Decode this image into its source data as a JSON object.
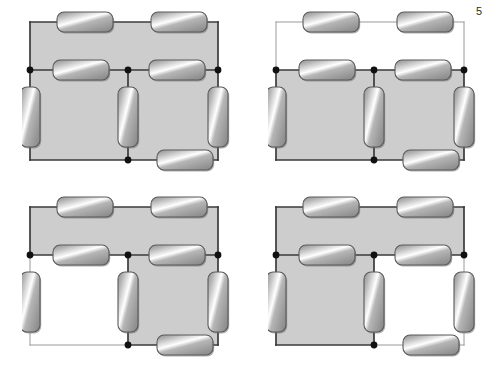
{
  "figure": {
    "title": "",
    "background_color": "#ffffff",
    "shade_color": "#cdcdcd",
    "wire_color_dark": "#3a3a3a",
    "wire_color_light": "#9a9a9a",
    "node_color": "#111111",
    "resistor_body_light": "#f2f2f2",
    "resistor_body_mid": "#b6b6b6",
    "resistor_body_dark": "#8f8f8f",
    "resistor_border": "#5a5a5a",
    "corner_note": "5"
  },
  "panels": [
    {
      "id": "panel-top-left",
      "name": "circuit-top-left",
      "label": "",
      "x": 22,
      "y": 8,
      "width": 212,
      "height": 176,
      "shaded_loops": [
        "top",
        "bottom-left",
        "bottom-right"
      ],
      "unshaded_loops": [],
      "dim_wires": [],
      "resistors": [
        {
          "name": "r-top-left",
          "orientation": "horizontal",
          "loop_edge": "top-left"
        },
        {
          "name": "r-top-right",
          "orientation": "horizontal",
          "loop_edge": "top-right"
        },
        {
          "name": "r-middle-left",
          "orientation": "horizontal",
          "loop_edge": "middle-left"
        },
        {
          "name": "r-middle-right",
          "orientation": "horizontal",
          "loop_edge": "middle-right"
        },
        {
          "name": "r-bottom-right",
          "orientation": "horizontal",
          "loop_edge": "bottom-right"
        },
        {
          "name": "r-left-branch",
          "orientation": "vertical",
          "loop_edge": "left"
        },
        {
          "name": "r-center-branch",
          "orientation": "vertical",
          "loop_edge": "center"
        },
        {
          "name": "r-right-branch",
          "orientation": "vertical",
          "loop_edge": "right"
        }
      ],
      "nodes": [
        "left-middle",
        "center-middle",
        "right-middle",
        "center-bottom"
      ]
    },
    {
      "id": "panel-top-right",
      "name": "circuit-top-right",
      "label": "",
      "x": 268,
      "y": 8,
      "width": 212,
      "height": 176,
      "shaded_loops": [
        "bottom-left",
        "bottom-right"
      ],
      "unshaded_loops": [
        "top"
      ],
      "dim_wires": [
        "top-rail",
        "left-upper",
        "right-upper"
      ],
      "resistors": [
        {
          "name": "r-top-left",
          "orientation": "horizontal",
          "loop_edge": "top-left"
        },
        {
          "name": "r-top-right",
          "orientation": "horizontal",
          "loop_edge": "top-right"
        },
        {
          "name": "r-middle-left",
          "orientation": "horizontal",
          "loop_edge": "middle-left"
        },
        {
          "name": "r-middle-right",
          "orientation": "horizontal",
          "loop_edge": "middle-right"
        },
        {
          "name": "r-bottom-right",
          "orientation": "horizontal",
          "loop_edge": "bottom-right"
        },
        {
          "name": "r-left-branch",
          "orientation": "vertical",
          "loop_edge": "left"
        },
        {
          "name": "r-center-branch",
          "orientation": "vertical",
          "loop_edge": "center"
        },
        {
          "name": "r-right-branch",
          "orientation": "vertical",
          "loop_edge": "right"
        }
      ],
      "nodes": [
        "left-middle",
        "center-middle",
        "right-middle",
        "center-bottom"
      ]
    },
    {
      "id": "panel-bottom-left",
      "name": "circuit-bottom-left",
      "label": "",
      "x": 22,
      "y": 193,
      "width": 212,
      "height": 176,
      "shaded_loops": [
        "top",
        "bottom-right"
      ],
      "unshaded_loops": [
        "bottom-left"
      ],
      "dim_wires": [
        "bottom-left-rail",
        "left-lower"
      ],
      "resistors": [
        {
          "name": "r-top-left",
          "orientation": "horizontal",
          "loop_edge": "top-left"
        },
        {
          "name": "r-top-right",
          "orientation": "horizontal",
          "loop_edge": "top-right"
        },
        {
          "name": "r-middle-left",
          "orientation": "horizontal",
          "loop_edge": "middle-left"
        },
        {
          "name": "r-middle-right",
          "orientation": "horizontal",
          "loop_edge": "middle-right"
        },
        {
          "name": "r-bottom-right",
          "orientation": "horizontal",
          "loop_edge": "bottom-right"
        },
        {
          "name": "r-left-branch",
          "orientation": "vertical",
          "loop_edge": "left"
        },
        {
          "name": "r-center-branch",
          "orientation": "vertical",
          "loop_edge": "center"
        },
        {
          "name": "r-right-branch",
          "orientation": "vertical",
          "loop_edge": "right"
        }
      ],
      "nodes": [
        "left-middle",
        "center-middle",
        "right-middle",
        "center-bottom"
      ]
    },
    {
      "id": "panel-bottom-right",
      "name": "circuit-bottom-right",
      "label": "",
      "x": 268,
      "y": 193,
      "width": 212,
      "height": 176,
      "shaded_loops": [
        "top",
        "bottom-left"
      ],
      "unshaded_loops": [
        "bottom-right"
      ],
      "dim_wires": [
        "bottom-right-rail",
        "right-lower"
      ],
      "resistors": [
        {
          "name": "r-top-left",
          "orientation": "horizontal",
          "loop_edge": "top-left"
        },
        {
          "name": "r-top-right",
          "orientation": "horizontal",
          "loop_edge": "top-right"
        },
        {
          "name": "r-middle-left",
          "orientation": "horizontal",
          "loop_edge": "middle-left"
        },
        {
          "name": "r-middle-right",
          "orientation": "horizontal",
          "loop_edge": "middle-right"
        },
        {
          "name": "r-bottom-right",
          "orientation": "horizontal",
          "loop_edge": "bottom-right"
        },
        {
          "name": "r-left-branch",
          "orientation": "vertical",
          "loop_edge": "left"
        },
        {
          "name": "r-center-branch",
          "orientation": "vertical",
          "loop_edge": "center"
        },
        {
          "name": "r-right-branch",
          "orientation": "vertical",
          "loop_edge": "right"
        }
      ],
      "nodes": [
        "left-middle",
        "center-middle",
        "right-middle",
        "center-bottom"
      ]
    }
  ]
}
